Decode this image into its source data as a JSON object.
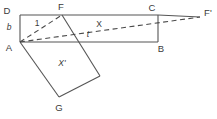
{
  "figure": {
    "kind": "geometry-diagram",
    "width": 217,
    "height": 119,
    "background_color": "#ffffff",
    "stroke_color": "#555555",
    "dash_color": "#4a4a4a",
    "text_color": "#3a3a3a",
    "vertices": {
      "D": {
        "label": "D",
        "x": 20,
        "y": 15,
        "label_x": 7,
        "label_y": 11
      },
      "F": {
        "label": "F",
        "x": 62,
        "y": 15,
        "label_x": 61,
        "label_y": 7
      },
      "C": {
        "label": "C",
        "x": 158,
        "y": 15,
        "label_x": 152,
        "label_y": 8
      },
      "Fprime": {
        "label": "F'",
        "x": 200,
        "y": 17,
        "label_x": 208,
        "label_y": 13
      },
      "A": {
        "label": "A",
        "x": 20,
        "y": 42,
        "label_x": 9,
        "label_y": 48
      },
      "B": {
        "label": "B",
        "x": 158,
        "y": 42,
        "label_x": 161,
        "label_y": 49
      },
      "G": {
        "label": "G",
        "x": 59,
        "y": 97,
        "label_x": 59,
        "label_y": 108
      },
      "H": {
        "label": "",
        "x": 100,
        "y": 76,
        "label_x": 0,
        "label_y": 0
      }
    },
    "measures": [
      {
        "id": "b",
        "text": "b",
        "x": 9,
        "y": 27,
        "italic": true
      },
      {
        "id": "one",
        "text": "1",
        "x": 37,
        "y": 23,
        "italic": false
      },
      {
        "id": "X",
        "text": "X",
        "x": 99,
        "y": 24,
        "italic": false
      },
      {
        "id": "t",
        "text": "t",
        "x": 88,
        "y": 34,
        "italic": true
      },
      {
        "id": "Xprime",
        "text": "X'",
        "x": 62,
        "y": 63,
        "italic": true
      }
    ],
    "solid_edges": [
      {
        "id": "edge-DC",
        "from": "D",
        "to": "C"
      },
      {
        "id": "edge-DA",
        "from": "D",
        "to": "A"
      },
      {
        "id": "edge-AB",
        "from": "A",
        "to": "B"
      },
      {
        "id": "edge-CB",
        "from": "C",
        "to": "B"
      },
      {
        "id": "edge-AG",
        "from": "A",
        "to": "G"
      },
      {
        "id": "edge-FH",
        "from": "F",
        "to": "H"
      },
      {
        "id": "edge-GH",
        "from": "G",
        "to": "H"
      },
      {
        "id": "edge-CFp",
        "from": "C",
        "to": "Fprime"
      }
    ],
    "dashed_edges": [
      {
        "id": "dash-AF",
        "from": "A",
        "to": "F"
      },
      {
        "id": "dash-AFp",
        "from": "A",
        "to": "Fprime"
      }
    ]
  }
}
